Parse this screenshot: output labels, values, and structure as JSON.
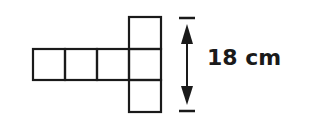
{
  "diagram": {
    "type": "cube-net",
    "square_count": 6,
    "stroke_color": "#1a1a1a",
    "dimension": {
      "label": "18 cm",
      "value": 18,
      "unit": "cm",
      "orientation": "vertical",
      "spans": "three squares (height of the vertical column)"
    }
  }
}
